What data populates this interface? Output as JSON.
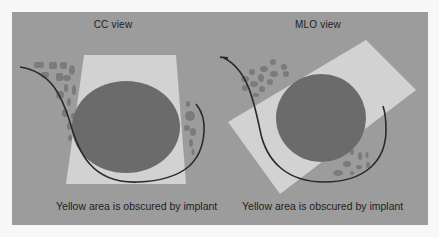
{
  "figure": {
    "colors": {
      "background": "#9c9c9c",
      "obscured_area": "#d2d2d2",
      "implant": "#6b6b6b",
      "tissue_dots": "#7d7d7d",
      "skin_line": "#2a2a2a",
      "outer_border": "#f7f7f7"
    },
    "views": [
      {
        "title": "CC  view",
        "caption": "Yellow area is obscured by implant"
      },
      {
        "title": "MLO  view",
        "caption": "Yellow area is obscured by implant"
      }
    ]
  }
}
